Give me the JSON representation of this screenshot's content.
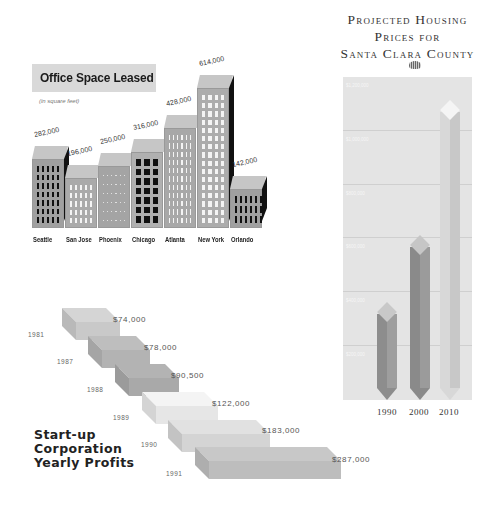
{
  "office": {
    "title": "Office Space Leased",
    "subtitle": "(in square feet)"
  },
  "housing": {
    "title_lines": [
      "Projected Housing",
      "Prices for",
      "Santa Clara County"
    ],
    "y_labels": [
      "$1,200,000",
      "$1,000,000",
      "$800,000",
      "$600,000",
      "$400,000",
      "$200,000"
    ],
    "years": [
      "1990",
      "2000",
      "2010"
    ]
  },
  "profits": {
    "title_lines": [
      "Start-up",
      "Corporation",
      "Yearly Profits"
    ]
  },
  "chart_data": [
    {
      "type": "bar",
      "title": "Office Space Leased",
      "subtitle": "(in square feet)",
      "xlabel": "",
      "ylabel": "Square feet",
      "categories": [
        "Seattle",
        "San Jose",
        "Phoenix",
        "Chicago",
        "Atlanta",
        "New York",
        "Orlando"
      ],
      "values": [
        282000,
        196000,
        250000,
        316000,
        428000,
        614000,
        142000
      ],
      "value_labels": [
        "282,000",
        "196,000",
        "250,000",
        "316,000",
        "428,000",
        "614,000",
        "142,000"
      ],
      "style": "3D building pictograph",
      "grid": false,
      "legend": null
    },
    {
      "type": "bar",
      "title": "Projected Housing Prices for Santa Clara County",
      "xlabel": "",
      "ylabel": "Price",
      "categories": [
        "1990",
        "2000",
        "2010"
      ],
      "values": [
        400000,
        650000,
        1150000
      ],
      "y_tick_labels": [
        "$200,000",
        "$400,000",
        "$600,000",
        "$800,000",
        "$1,000,000",
        "$1,200,000"
      ],
      "ylim": [
        0,
        1200000
      ],
      "grid": true,
      "style": "vertical pencil-shaped bars",
      "legend": null
    },
    {
      "type": "bar",
      "title": "Start-up Corporation Yearly Profits",
      "xlabel": "",
      "ylabel": "Profit",
      "categories": [
        "1981",
        "1987",
        "1988",
        "1989",
        "1990",
        "1991"
      ],
      "values": [
        74000,
        78000,
        90500,
        122000,
        183000,
        287000
      ],
      "value_labels": [
        "$74,000",
        "$78,000",
        "$90,500",
        "$122,000",
        "$183,000",
        "$287,000"
      ],
      "style": "3D staircase slabs",
      "grid": false,
      "legend": null
    }
  ]
}
